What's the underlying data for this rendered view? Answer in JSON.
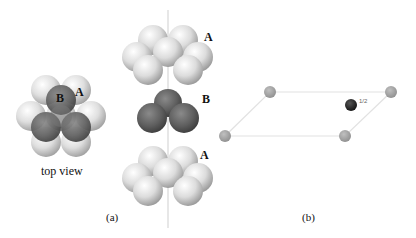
{
  "figure": {
    "panel_a": {
      "caption": "(a)",
      "top_view_label": "top view",
      "top_view_layer_labels": {
        "upper": "B",
        "lower": "A"
      },
      "stack_layers": [
        {
          "label": "A",
          "position": "top"
        },
        {
          "label": "B",
          "position": "middle"
        },
        {
          "label": "A",
          "position": "bottom"
        }
      ]
    },
    "panel_b": {
      "caption": "(b)",
      "fraction_label": "1/2"
    },
    "colors": {
      "light_sphere": "#d8d8d8",
      "dark_sphere": "#5a5a5a",
      "lattice_atom": "#a0a0a0",
      "interior_atom": "#2a2a2a",
      "lattice_line": "#e2e2e2",
      "axis_line": "#c8c8c8"
    }
  }
}
